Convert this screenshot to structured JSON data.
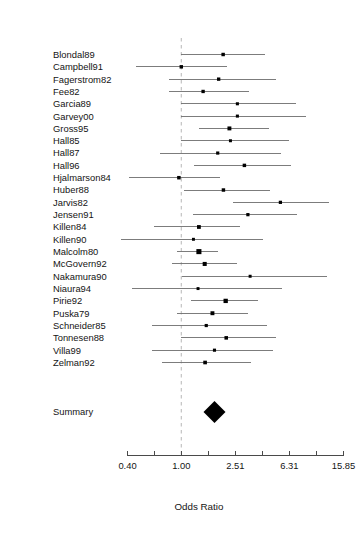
{
  "chart_data": {
    "type": "forest",
    "title": "",
    "xlabel": "Odds Ratio",
    "ylabel": "",
    "scale": "log",
    "reference_line": 1.0,
    "xlim": [
      0.4,
      15.85
    ],
    "grid": false,
    "legend": "none",
    "tick_labels": [
      "0.40",
      "1.00",
      "2.51",
      "6.31",
      "15.85"
    ],
    "tick_values": [
      0.4,
      1.0,
      2.51,
      6.31,
      15.85
    ],
    "minor_ticks": [
      0.63,
      1.58,
      3.98,
      10.0
    ],
    "summary_label": "Summary",
    "summary": {
      "label": "Summary",
      "estimate": 1.76,
      "ci_low": 1.46,
      "ci_high": 2.14
    },
    "categories": [
      "Blondal89",
      "Campbell91",
      "Fagerstrom82",
      "Fee82",
      "Garcia89",
      "Garvey00",
      "Gross95",
      "Hall85",
      "Hall87",
      "Hall96",
      "Hjalmarson84",
      "Huber88",
      "Jarvis82",
      "Jensen91",
      "Killen84",
      "Killen90",
      "Malcolm80",
      "McGovern92",
      "Nakamura90",
      "Niaura94",
      "Pirie92",
      "Puska79",
      "Schneider85",
      "Tonnesen88",
      "Villa99",
      "Zelman92"
    ],
    "studies": [
      {
        "label": "Blondal89",
        "estimate": 2.04,
        "ci_low": 1.0,
        "ci_high": 4.19,
        "weight": 2.3
      },
      {
        "label": "Campbell91",
        "estimate": 1.0,
        "ci_low": 0.46,
        "ci_high": 2.19,
        "weight": 2.3
      },
      {
        "label": "Fagerstrom82",
        "estimate": 1.89,
        "ci_low": 0.81,
        "ci_high": 5.03,
        "weight": 2.1
      },
      {
        "label": "Fee82",
        "estimate": 1.45,
        "ci_low": 0.81,
        "ci_high": 3.16,
        "weight": 2.1
      },
      {
        "label": "Garcia89",
        "estimate": 2.6,
        "ci_low": 1.0,
        "ci_high": 7.1,
        "weight": 1.6
      },
      {
        "label": "Garvey00",
        "estimate": 2.6,
        "ci_low": 1.0,
        "ci_high": 8.4,
        "weight": 1.6
      },
      {
        "label": "Gross95",
        "estimate": 2.27,
        "ci_low": 1.36,
        "ci_high": 4.48,
        "weight": 3.3
      },
      {
        "label": "Hall85",
        "estimate": 2.31,
        "ci_low": 1.0,
        "ci_high": 6.3,
        "weight": 1.5
      },
      {
        "label": "Hall87",
        "estimate": 1.86,
        "ci_low": 0.69,
        "ci_high": 5.45,
        "weight": 1.8
      },
      {
        "label": "Hall96",
        "estimate": 2.93,
        "ci_low": 1.24,
        "ci_high": 6.45,
        "weight": 2.3
      },
      {
        "label": "Hjalmarson84",
        "estimate": 0.96,
        "ci_low": 0.41,
        "ci_high": 1.93,
        "weight": 2.4
      },
      {
        "label": "Huber88",
        "estimate": 2.05,
        "ci_low": 1.05,
        "ci_high": 4.55,
        "weight": 2.3
      },
      {
        "label": "Jarvis82",
        "estimate": 5.41,
        "ci_low": 2.43,
        "ci_high": 12.4,
        "weight": 1.9
      },
      {
        "label": "Jensen91",
        "estimate": 3.11,
        "ci_low": 1.22,
        "ci_high": 7.15,
        "weight": 1.9
      },
      {
        "label": "Killen84",
        "estimate": 1.35,
        "ci_low": 0.63,
        "ci_high": 2.7,
        "weight": 3.0
      },
      {
        "label": "Killen90",
        "estimate": 1.23,
        "ci_low": 0.36,
        "ci_high": 4.0,
        "weight": 1.4
      },
      {
        "label": "Malcolm80",
        "estimate": 1.35,
        "ci_low": 0.93,
        "ci_high": 1.86,
        "weight": 6.5
      },
      {
        "label": "McGovern92",
        "estimate": 1.49,
        "ci_low": 0.86,
        "ci_high": 2.6,
        "weight": 3.6
      },
      {
        "label": "Nakamura90",
        "estimate": 3.23,
        "ci_low": 1.02,
        "ci_high": 12.0,
        "weight": 1.5
      },
      {
        "label": "Niaura94",
        "estimate": 1.33,
        "ci_low": 0.43,
        "ci_high": 5.6,
        "weight": 1.4
      },
      {
        "label": "Pirie92",
        "estimate": 2.13,
        "ci_low": 1.18,
        "ci_high": 3.67,
        "weight": 4.3
      },
      {
        "label": "Puska79",
        "estimate": 1.7,
        "ci_low": 0.93,
        "ci_high": 3.09,
        "weight": 3.3
      },
      {
        "label": "Schneider85",
        "estimate": 1.53,
        "ci_low": 0.61,
        "ci_high": 4.3,
        "weight": 1.8
      },
      {
        "label": "Tonnesen88",
        "estimate": 2.15,
        "ci_low": 1.0,
        "ci_high": 5.0,
        "weight": 2.5
      },
      {
        "label": "Villa99",
        "estimate": 1.76,
        "ci_low": 0.61,
        "ci_high": 4.8,
        "weight": 1.7
      },
      {
        "label": "Zelman92",
        "estimate": 1.5,
        "ci_low": 0.72,
        "ci_high": 3.3,
        "weight": 2.7
      }
    ]
  }
}
